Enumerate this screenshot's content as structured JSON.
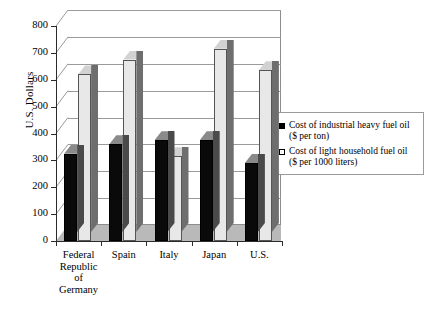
{
  "chart_data": {
    "type": "bar",
    "title": "",
    "xlabel": "",
    "ylabel": "U.S. Dollars",
    "ylim": [
      0,
      800
    ],
    "yticks": [
      0,
      100,
      200,
      300,
      400,
      500,
      600,
      700,
      800
    ],
    "ytick_labels": [
      "0",
      "100",
      "200",
      "300",
      "400",
      "500",
      "600",
      "700",
      "800"
    ],
    "grid": true,
    "legend_position": "right",
    "categories": [
      "Federal\nRepublic\nof\nGermany",
      "Spain",
      "Italy",
      "Japan",
      "U.S."
    ],
    "series": [
      {
        "name": "Cost of industrial heavy fuel oil\n($ per ton)",
        "key": "industrial-heavy-fuel-oil",
        "color": "#0a0a0a",
        "values": [
          325,
          360,
          375,
          375,
          290
        ]
      },
      {
        "name": "Cost of light household fuel oil\n($ per 1000 liters)",
        "key": "light-household-fuel-oil",
        "color": "#e8e8e8",
        "values": [
          620,
          675,
          315,
          715,
          635
        ]
      }
    ]
  },
  "legend": {
    "items": [
      {
        "marker": "filled-square",
        "label": "Cost of industrial heavy fuel oil\n($ per ton)"
      },
      {
        "marker": "hollow-square",
        "label": "Cost of light household fuel oil\n($ per 1000 liters)"
      }
    ]
  },
  "colors": {
    "dark_bar": "#0a0a0a",
    "light_bar": "#e8e8e8",
    "axis": "#2b2b2b",
    "gridline": "#9a9a9a",
    "floor": "#b9b9b9",
    "background": "#ffffff"
  }
}
